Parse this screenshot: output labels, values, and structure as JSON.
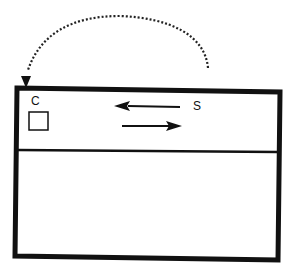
{
  "diagram": {
    "labels": {
      "client": "C",
      "server": "S"
    },
    "elements": {
      "outer_box": "rectangle",
      "divider": "horizontal-line",
      "client_node": "small-square",
      "arrow_top": "arrow-left",
      "arrow_bottom": "arrow-right",
      "curved_arrow": "dotted-arc-arrow"
    },
    "colors": {
      "stroke": "#111111",
      "background": "#ffffff"
    }
  }
}
